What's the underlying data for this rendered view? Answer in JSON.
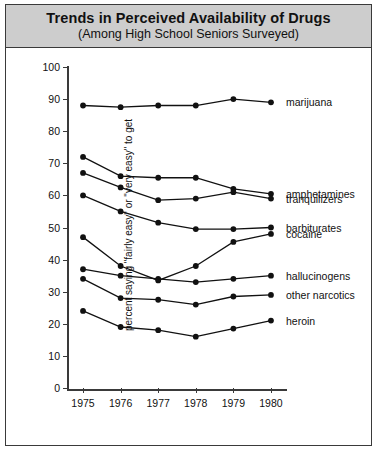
{
  "title": {
    "main": "Trends in Perceived Availability of Drugs",
    "sub": "(Among High School Seniors Surveyed)"
  },
  "chart_data": {
    "type": "line",
    "title": "Trends in Perceived Availability of Drugs",
    "subtitle": "(Among High School Seniors Surveyed)",
    "xlabel": "",
    "ylabel": "percent saying \"fairly easy\" or \"very easy\" to get",
    "categories": [
      "1975",
      "1976",
      "1977",
      "1978",
      "1979",
      "1980"
    ],
    "x": [
      1975,
      1976,
      1977,
      1978,
      1979,
      1980
    ],
    "xlim": [
      1974.6,
      1980.4
    ],
    "ylim": [
      0,
      100
    ],
    "yticks": [
      0,
      10,
      20,
      30,
      40,
      50,
      60,
      70,
      80,
      90,
      100
    ],
    "ytick_labels": [
      "0",
      "10",
      "20",
      "30",
      "40",
      "50",
      "60",
      "70",
      "80",
      "90",
      "100"
    ],
    "grid": false,
    "legend": "right-inline-labels",
    "marker": "filled-circle",
    "line_color": "#111111",
    "series": [
      {
        "name": "marijuana",
        "values": [
          88,
          87.5,
          88,
          88,
          90,
          89
        ]
      },
      {
        "name": "amphetamines",
        "values": [
          72,
          66,
          65.5,
          65.5,
          62,
          60.5
        ]
      },
      {
        "name": "tranquilizers",
        "values": [
          67,
          62.5,
          58.5,
          59,
          61,
          59
        ]
      },
      {
        "name": "barbiturates",
        "values": [
          60,
          55,
          51.5,
          49.5,
          49.5,
          50
        ]
      },
      {
        "name": "cocaine",
        "values": [
          47,
          38,
          33.5,
          38,
          45.5,
          48
        ]
      },
      {
        "name": "hallucinogens",
        "values": [
          37,
          35,
          34,
          33,
          34,
          35
        ]
      },
      {
        "name": "other narcotics",
        "values": [
          34,
          28,
          27.5,
          26,
          28.5,
          29
        ]
      },
      {
        "name": "heroin",
        "values": [
          24,
          19,
          18,
          16,
          18.5,
          21
        ]
      }
    ]
  }
}
